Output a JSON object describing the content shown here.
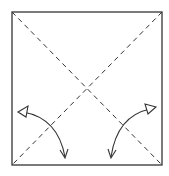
{
  "diagram": {
    "type": "origami-fold-diagram",
    "colors": {
      "background": "#ffffff",
      "line": "#333333"
    },
    "square": {
      "x": 12,
      "y": 12,
      "width": 150,
      "height": 153
    },
    "fold_lines": [
      {
        "name": "diagonal-tl-br",
        "style": "dashed",
        "from": [
          12,
          12
        ],
        "to": [
          162,
          165
        ]
      },
      {
        "name": "diagonal-tr-bl",
        "style": "dashed",
        "from": [
          162,
          12
        ],
        "to": [
          12,
          165
        ]
      }
    ],
    "arrows": [
      {
        "name": "left-fold-arrow",
        "start": [
          20,
          110
        ],
        "end": [
          65,
          158
        ],
        "start_head": "hollow-triangle",
        "end_head": "open-v"
      },
      {
        "name": "right-fold-arrow",
        "start": [
          154,
          106
        ],
        "end": [
          111,
          158
        ],
        "start_head": "hollow-triangle",
        "end_head": "open-v"
      }
    ]
  }
}
